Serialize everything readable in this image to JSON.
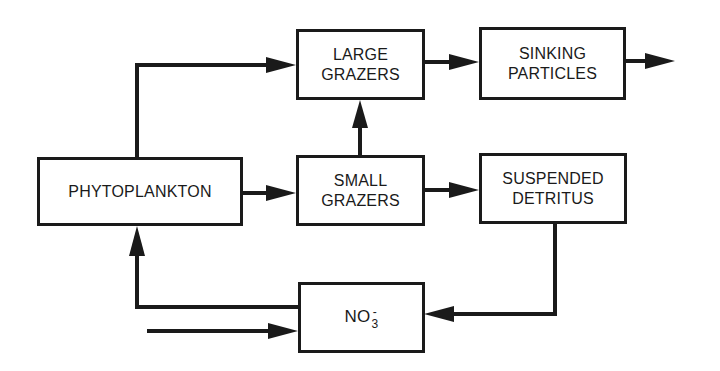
{
  "diagram": {
    "type": "flow-diagram",
    "nodes": {
      "phytoplankton": {
        "lines": [
          "PHYTOPLANKTON"
        ]
      },
      "large_grazers": {
        "lines": [
          "LARGE",
          "GRAZERS"
        ]
      },
      "sinking_particles": {
        "lines": [
          "SINKING",
          "PARTICLES"
        ]
      },
      "small_grazers": {
        "lines": [
          "SMALL",
          "GRAZERS"
        ]
      },
      "suspended_detritus": {
        "lines": [
          "SUSPENDED",
          "DETRITUS"
        ]
      },
      "nitrate": {
        "base": "NO",
        "subscript": "3",
        "superscript": "-"
      }
    },
    "edges": [
      {
        "from": "phytoplankton",
        "to": "large_grazers"
      },
      {
        "from": "phytoplankton",
        "to": "small_grazers"
      },
      {
        "from": "small_grazers",
        "to": "large_grazers"
      },
      {
        "from": "large_grazers",
        "to": "sinking_particles"
      },
      {
        "from": "sinking_particles",
        "to": "export"
      },
      {
        "from": "small_grazers",
        "to": "suspended_detritus"
      },
      {
        "from": "suspended_detritus",
        "to": "nitrate"
      },
      {
        "from": "nitrate",
        "to": "phytoplankton"
      },
      {
        "from": "external_input",
        "to": "nitrate"
      }
    ],
    "colors": {
      "ink": "#1a1a1a",
      "background": "#ffffff"
    }
  }
}
